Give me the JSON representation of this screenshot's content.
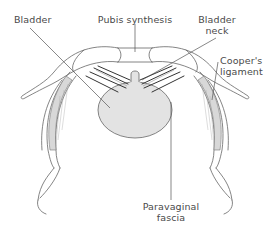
{
  "diagram": {
    "labels": {
      "bladder": "Bladder",
      "pubis_synthesis": "Pubis synthesis",
      "bladder_neck": [
        "Bladder",
        "neck"
      ],
      "coopers_ligament": [
        "Cooper's",
        "ligament"
      ],
      "paravaginal_fascia": [
        "Paravaginal",
        "fascia"
      ]
    },
    "colors": {
      "line": "#555555",
      "bladder_fill": "#e3e3e3",
      "ligament_fill": "#d6d6d6",
      "strap": "#333333",
      "text": "#4a4a4a"
    }
  }
}
